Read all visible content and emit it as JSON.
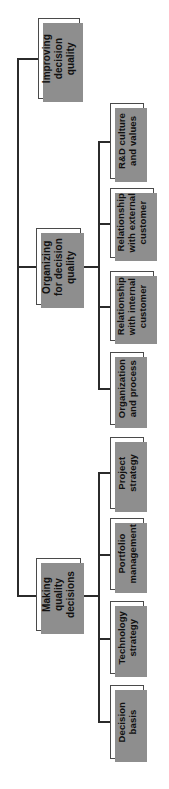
{
  "diagram": {
    "type": "tree-hierarchy",
    "orientation": "rotated-90-counterclockwise",
    "colors": {
      "box_fill": "#ffffff",
      "box_border": "#4a4a4a",
      "box_shadow": "#8e8e8e",
      "connector": "#2b2b2b",
      "text": "#111111",
      "background": "#ffffff"
    },
    "root": {
      "label": "Improving\ndecision\nquality"
    },
    "branches": [
      {
        "label": "Organizing\nfor decision\nquality",
        "children": [
          {
            "label": "R&D culture\nand values"
          },
          {
            "label": "Relationship\nwith external\ncustomer"
          },
          {
            "label": "Relationship\nwith internal\ncustomer"
          },
          {
            "label": "Organization\nand process"
          }
        ]
      },
      {
        "label": "Making\nquality\ndecisions",
        "children": [
          {
            "label": "Project\nstrategy"
          },
          {
            "label": "Portfolio\nmanagement"
          },
          {
            "label": "Technology\nstrategy"
          },
          {
            "label": "Decision\nbasis"
          }
        ]
      }
    ]
  }
}
